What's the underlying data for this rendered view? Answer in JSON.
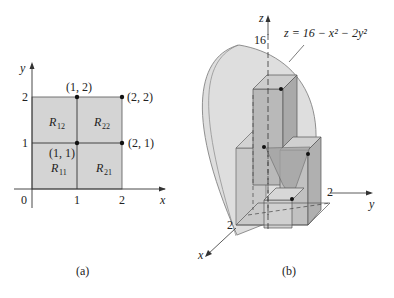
{
  "figure_a": {
    "caption": "(a)",
    "axes": {
      "x_label": "x",
      "y_label": "y",
      "origin": "0",
      "x_ticks": [
        "1",
        "2"
      ],
      "y_ticks": [
        "1",
        "2"
      ]
    },
    "regions": [
      {
        "name": "R",
        "sub": "11"
      },
      {
        "name": "R",
        "sub": "21"
      },
      {
        "name": "R",
        "sub": "12"
      },
      {
        "name": "R",
        "sub": "22"
      }
    ],
    "points": [
      "(1, 2)",
      "(2, 2)",
      "(1, 1)",
      "(2, 1)"
    ],
    "fill_color": "#d4d4d4"
  },
  "figure_b": {
    "caption": "(b)",
    "axes": {
      "x_label": "x",
      "y_label": "y",
      "z_label": "z"
    },
    "z_tick": "16",
    "x_tick": "2",
    "y_tick": "2",
    "surface_label": "z = 16 − x² − 2y²",
    "surface_color": "#dcdcdc",
    "box_color": "#c2c2c2"
  }
}
